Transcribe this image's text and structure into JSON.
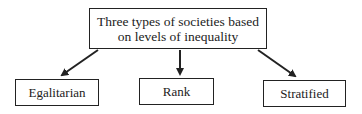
{
  "diagram": {
    "root": {
      "line1": "Three types of societies based",
      "line2": "on levels of inequality"
    },
    "children": [
      {
        "label": "Egalitarian"
      },
      {
        "label": "Rank"
      },
      {
        "label": "Stratified"
      }
    ],
    "edges": [
      {
        "from": "root",
        "to": "Egalitarian"
      },
      {
        "from": "root",
        "to": "Rank"
      },
      {
        "from": "root",
        "to": "Stratified"
      }
    ],
    "colors": {
      "stroke": "#222222",
      "background": "#ffffff"
    }
  }
}
